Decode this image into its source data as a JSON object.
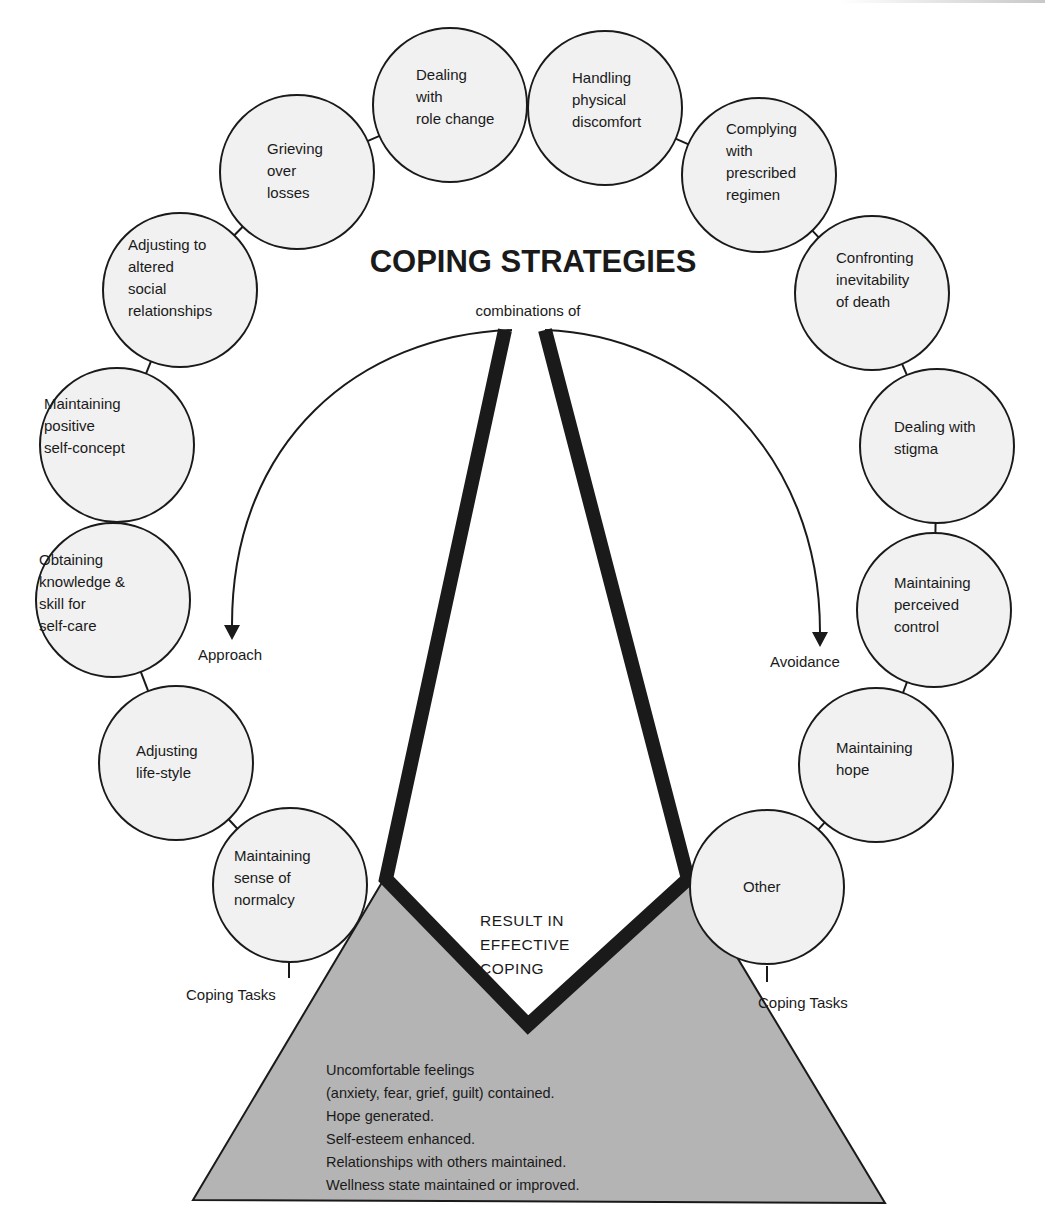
{
  "title": "COPING STRATEGIES",
  "subtitle": "combinations of",
  "strategies": {
    "approach": "Approach",
    "avoidance": "Avoidance"
  },
  "result": [
    "RESULT IN",
    "EFFECTIVE",
    "COPING"
  ],
  "coping_tasks_label_left": "Coping Tasks",
  "coping_tasks_label_right": "Coping Tasks",
  "tasks": [
    {
      "lines": [
        "Adjusting",
        "life-style"
      ]
    },
    {
      "lines": [
        "Obtaining",
        "knowledge &",
        "skill  for",
        "self-care"
      ]
    },
    {
      "lines": [
        "Maintaining",
        "positive",
        "self-concept"
      ]
    },
    {
      "lines": [
        "Adjusting to",
        "altered",
        "social",
        "relationships"
      ]
    },
    {
      "lines": [
        "Grieving",
        "over",
        "losses"
      ]
    },
    {
      "lines": [
        "Dealing",
        "with",
        "role change"
      ]
    },
    {
      "lines": [
        "Handling",
        "physical",
        "discomfort"
      ]
    },
    {
      "lines": [
        "Complying",
        "with",
        "prescribed",
        "regimen"
      ]
    },
    {
      "lines": [
        "Confronting",
        "inevitability",
        "of  death"
      ]
    },
    {
      "lines": [
        "Dealing  with",
        "stigma"
      ]
    },
    {
      "lines": [
        "Maintaining",
        "perceived",
        "control"
      ]
    },
    {
      "lines": [
        "Maintaining",
        "hope"
      ]
    },
    {
      "lines": [
        "Other"
      ]
    },
    {
      "lines": [
        "Maintaining",
        "sense  of",
        "normalcy"
      ]
    }
  ],
  "outcomes": [
    "Uncomfortable feelings",
    "(anxiety, fear, grief, guilt) contained.",
    "Hope generated.",
    "Self-esteem enhanced.",
    "Relationships with others maintained.",
    "Wellness state maintained or improved."
  ],
  "colors": {
    "circle_fill": "#f1f1f1",
    "stroke": "#1a1a1a",
    "triangle_fill": "#b4b4b4"
  }
}
